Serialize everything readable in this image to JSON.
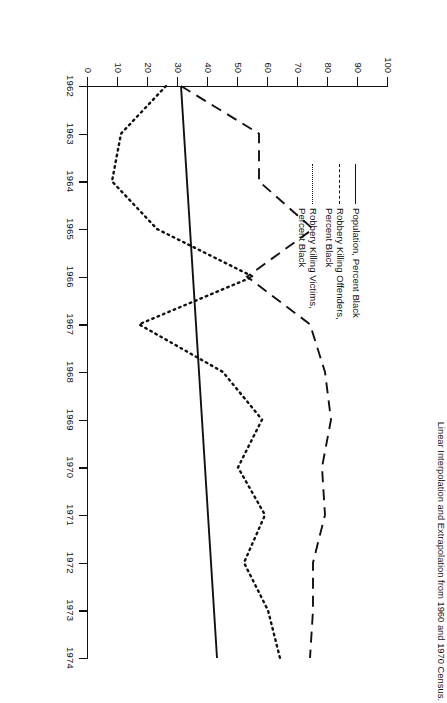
{
  "figure": {
    "caption": "Linear Interpolation and Extrapolation from 1960 and 1970 Census.",
    "rotation_degrees": 90
  },
  "legend": {
    "position": "upper-left-inside",
    "entries": [
      {
        "style": "solid",
        "line1": "Population, Percent Black",
        "line2": ""
      },
      {
        "style": "dashed",
        "line1": "Robbery Killing Offenders,",
        "line2": "Percent Black"
      },
      {
        "style": "dotted",
        "line1": "Robbery Killing Victims,",
        "line2": "Percent Black"
      }
    ]
  },
  "axes": {
    "x_ticklabels": [
      "1962",
      "1963",
      "1964",
      "1965",
      "1966",
      "1967",
      "1968",
      "1969",
      "1970",
      "1971",
      "1972",
      "1973",
      "1974"
    ],
    "y_ticklabels": [
      "0",
      "10",
      "20",
      "30",
      "40",
      "50",
      "60",
      "70",
      "80",
      "90",
      "100"
    ]
  },
  "chart_data": {
    "type": "line",
    "title": "",
    "subtitle": "",
    "xlabel": "",
    "ylabel": "",
    "xlim": [
      1962,
      1974
    ],
    "ylim": [
      0,
      100
    ],
    "ytick_step": 10,
    "grid": false,
    "legend_position": "upper left",
    "annotations": [
      "Linear Interpolation and Extrapolation from 1960 and 1970 Census."
    ],
    "x": [
      1962,
      1963,
      1964,
      1965,
      1966,
      1967,
      1968,
      1969,
      1970,
      1971,
      1972,
      1973,
      1974
    ],
    "series": [
      {
        "name": "Population, Percent Black",
        "style": "solid",
        "color": "#111111",
        "values": [
          31,
          32,
          33,
          34,
          35,
          36,
          37,
          38,
          39,
          40,
          41,
          42,
          43
        ]
      },
      {
        "name": "Robbery Killing Offenders, Percent Black",
        "style": "dashed",
        "color": "#111111",
        "values": [
          31,
          57,
          57,
          75,
          53,
          74,
          79,
          81,
          78,
          79,
          75,
          75,
          74
        ]
      },
      {
        "name": "Robbery Killing Victims, Percent Black",
        "style": "dotted",
        "color": "#111111",
        "values": [
          26,
          11,
          8,
          23,
          55,
          17,
          45,
          58,
          50,
          59,
          52,
          60,
          64
        ]
      }
    ]
  }
}
